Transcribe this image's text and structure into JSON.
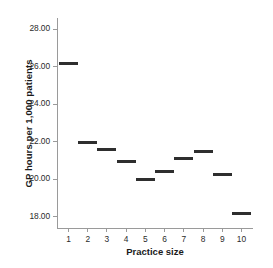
{
  "chart_data": {
    "type": "scatter",
    "title": "",
    "xlabel": "Practice size",
    "ylabel": "GP hours per 1,000 patients",
    "categories": [
      "1",
      "2",
      "3",
      "4",
      "5",
      "6",
      "7",
      "8",
      "9",
      "10"
    ],
    "values": [
      26.2,
      21.95,
      21.6,
      20.95,
      20.0,
      20.4,
      21.1,
      21.5,
      20.25,
      18.15
    ],
    "x_tick_labels": [
      "1",
      "2",
      "3",
      "4",
      "5",
      "6",
      "7",
      "8",
      "9",
      "10"
    ],
    "y_tick_labels": [
      "28.00",
      "26.00",
      "24.00",
      "22.00",
      "20.00",
      "18.00"
    ],
    "y_tick_values": [
      28.0,
      26.0,
      24.0,
      22.0,
      20.0,
      18.0
    ],
    "ylim": [
      17.4,
      28.6
    ],
    "xlim": [
      0.4,
      10.6
    ],
    "grid": false,
    "legend": false,
    "marker_style": "horizontal-dash",
    "marker_color": "#2e2e2e",
    "axis_color": "#9a9a9a"
  }
}
